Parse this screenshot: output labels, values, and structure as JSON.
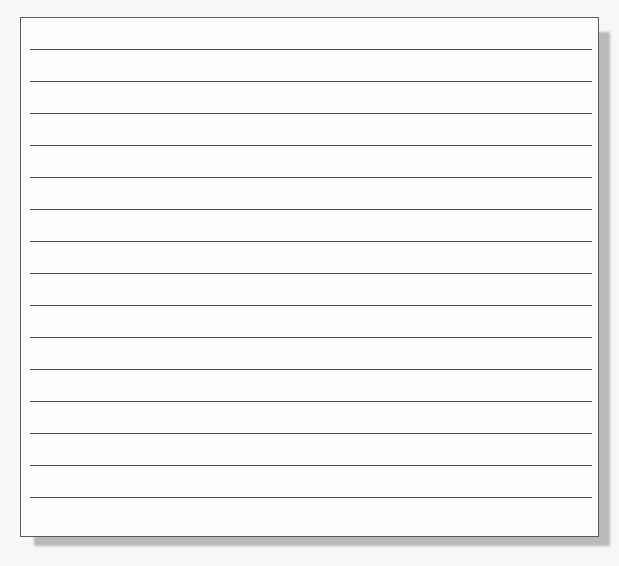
{
  "sheet": {
    "type": "lined-paper",
    "line_count": 15,
    "line_color": "#4a4a4a",
    "border_color": "#5a5a5a",
    "background_color": "#fdfdfd",
    "text": ""
  }
}
